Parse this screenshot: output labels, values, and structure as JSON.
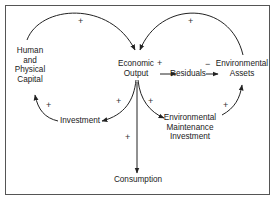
{
  "diagram": {
    "type": "causal-loop",
    "nodes": {
      "human_capital": [
        "Human",
        "and",
        "Physical",
        "Capital"
      ],
      "economic_output": [
        "Economic",
        "Output"
      ],
      "residuals": "Residuals",
      "environmental_assets": [
        "Environmental",
        "Assets"
      ],
      "investment": "Investment",
      "env_maintenance": [
        "Environmental",
        "Maintenance",
        "Investment"
      ],
      "consumption": "Consumption"
    },
    "links": [
      {
        "from": "Human and Physical Capital",
        "to": "Economic Output",
        "sign": "+"
      },
      {
        "from": "Environmental Assets",
        "to": "Economic Output",
        "sign": "+"
      },
      {
        "from": "Economic Output",
        "to": "Residuals",
        "sign": "+"
      },
      {
        "from": "Residuals",
        "to": "Environmental Assets",
        "sign": "−"
      },
      {
        "from": "Economic Output",
        "to": "Investment",
        "sign": "+"
      },
      {
        "from": "Investment",
        "to": "Human and Physical Capital",
        "sign": "+"
      },
      {
        "from": "Economic Output",
        "to": "Environmental Maintenance Investment",
        "sign": "+"
      },
      {
        "from": "Environmental Maintenance Investment",
        "to": "Environmental Assets",
        "sign": "+"
      },
      {
        "from": "Economic Output",
        "to": "Consumption",
        "sign": "+"
      }
    ],
    "signs": {
      "top_left": "+",
      "top_right": "+",
      "output_residuals": "+",
      "residuals_assets": "−",
      "output_investment": "+",
      "investment_capital": "+",
      "output_maintenance": "+",
      "maintenance_assets": "+",
      "output_consumption": "+"
    }
  }
}
